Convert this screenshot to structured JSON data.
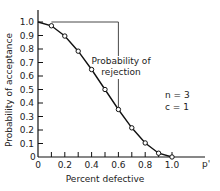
{
  "chart_data": {
    "type": "line",
    "title": "",
    "xlabel": "Percent defective",
    "ylabel": "Probability of acceptance",
    "x_axis_end_label": "p'",
    "xlim": [
      0,
      1.0
    ],
    "ylim": [
      0,
      1.0
    ],
    "x_ticks": [
      "0",
      "0.2",
      "0.4",
      "0.6",
      "0.8",
      "1.0"
    ],
    "y_ticks": [
      "0",
      "0.1",
      "0.2",
      "0.3",
      "0.4",
      "0.5",
      "0.6",
      "0.7",
      "0.8",
      "0.9",
      "1.0"
    ],
    "grid": false,
    "series": [
      {
        "name": "OC curve",
        "x": [
          0,
          0.1,
          0.2,
          0.3,
          0.4,
          0.5,
          0.6,
          0.7,
          0.8,
          0.9,
          1.0
        ],
        "y": [
          1.0,
          0.972,
          0.896,
          0.784,
          0.648,
          0.5,
          0.352,
          0.216,
          0.104,
          0.028,
          0.0
        ]
      }
    ],
    "annotations": [
      {
        "text": "Probability of rejection",
        "line1": "Probability of",
        "line2": "rejection",
        "at_x": 0.6
      },
      {
        "text": "n = 3"
      },
      {
        "text": "c = 1"
      }
    ]
  },
  "labels": {
    "ylabel": "Probability of acceptance",
    "xlabel": "Percent defective",
    "pprime": "p'",
    "rej1": "Probability of",
    "rej2": "rejection",
    "n": "n = 3",
    "c": "c = 1",
    "origin": "0"
  }
}
